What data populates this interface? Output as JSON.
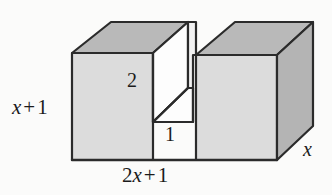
{
  "figure": {
    "name": "rectangular-solid-with-notch",
    "background_color": "#fbfbfa",
    "colors": {
      "top_face": "#b9b9b9",
      "front_face": "#dcdcdc",
      "right_face": "#b4b4b4",
      "notch_inner_light": "#fdfdfd",
      "notch_inner_shade": "#f2f2f2",
      "outline": "#2b2b2b",
      "label_text": "#1b1b1b"
    },
    "labels": {
      "height": {
        "coefficient": "",
        "variable": "x",
        "operator": "+",
        "constant": "1",
        "text": "x + 1"
      },
      "width": {
        "coefficient": "2",
        "variable": "x",
        "operator": "+",
        "constant": "1",
        "text": "2x + 1"
      },
      "depth": {
        "variable": "x",
        "text": "x"
      },
      "notch_depth": {
        "value": "2",
        "text": "2"
      },
      "notch_width": {
        "value": "1",
        "text": "1"
      }
    }
  }
}
